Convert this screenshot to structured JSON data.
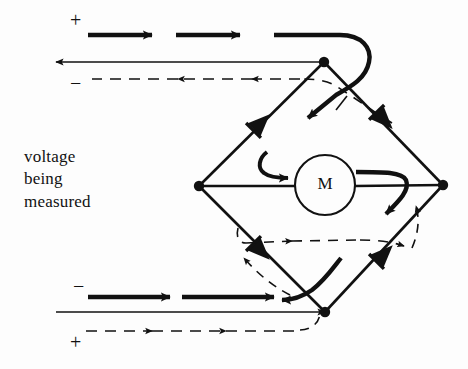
{
  "figure": {
    "type": "circuit-diagram",
    "background_color": "#fdfdfd",
    "ink_color": "#111111"
  },
  "caption": {
    "lines": [
      "voltage",
      "being",
      "measured"
    ]
  },
  "polarity_labels": {
    "top_plus": "+",
    "top_minus": "−",
    "bottom_minus": "−",
    "bottom_plus": "+"
  },
  "meter": {
    "label": "M",
    "shape": "circle",
    "center": [
      325,
      185
    ],
    "radius": 30
  },
  "nodes": [
    {
      "name": "top-node",
      "x": 324,
      "y": 62
    },
    {
      "name": "left-node",
      "x": 199,
      "y": 186
    },
    {
      "name": "right-node",
      "x": 443,
      "y": 185
    },
    {
      "name": "bottom-node",
      "x": 325,
      "y": 312
    }
  ],
  "diodes": [
    {
      "name": "diode-upper-left",
      "position": [
        262,
        122
      ],
      "points": "up-right"
    },
    {
      "name": "diode-upper-right",
      "position": [
        385,
        121
      ],
      "points": "down-right"
    },
    {
      "name": "diode-lower-left",
      "position": [
        262,
        252
      ],
      "points": "down-right"
    },
    {
      "name": "diode-lower-right",
      "position": [
        385,
        253
      ],
      "points": "up-right"
    }
  ],
  "current_paths": {
    "solid": {
      "name": "positive-half-cycle",
      "style": "solid thick",
      "description": "current enters top lead, flows through upper-left diode, meter left-to-right, lower-right diode, out bottom lead"
    },
    "dashed": {
      "name": "negative-half-cycle",
      "style": "dashed thin",
      "description": "current enters bottom lead, flows through lower-left diode, meter left-to-right, upper-right diode, out top lead"
    }
  },
  "leads": {
    "top_solid_arrow_direction": "right",
    "top_thin_arrow_direction": "left",
    "top_dashed_arrow_direction": "left",
    "bottom_solid_arrow_direction": "left",
    "bottom_thin_arrow_direction": "left",
    "bottom_dashed_arrow_direction": "right"
  }
}
